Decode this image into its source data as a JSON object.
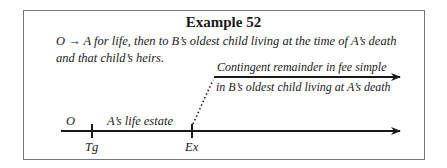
{
  "title": "Example 52",
  "description": {
    "grantor": "O",
    "arrow": "→",
    "text": "A for life, then to B’s oldest child living at the time of A’s death and that child’s heirs."
  },
  "timeline": {
    "segment_label_o": "O",
    "segment_label_life_estate": "A’s life estate",
    "tick_labels": [
      "Tg",
      "Ex"
    ],
    "remainder_label_line1": "Contingent remainder in fee simple",
    "remainder_label_line2": "in B’s oldest child living at A’s death"
  }
}
